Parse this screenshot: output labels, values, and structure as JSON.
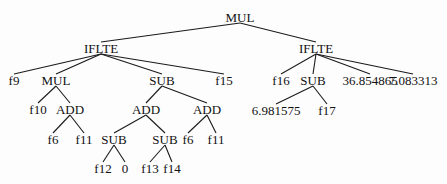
{
  "diagram": {
    "type": "expression-tree",
    "nodes": [
      {
        "id": "n0",
        "label": "MUL",
        "x": 240,
        "y": 17
      },
      {
        "id": "n1",
        "label": "IFLTE",
        "x": 101,
        "y": 48
      },
      {
        "id": "n2",
        "label": "IFLTE",
        "x": 316,
        "y": 48
      },
      {
        "id": "n3",
        "label": "f9",
        "x": 14,
        "y": 80
      },
      {
        "id": "n4",
        "label": "MUL",
        "x": 56,
        "y": 80
      },
      {
        "id": "n5",
        "label": "SUB",
        "x": 162,
        "y": 80
      },
      {
        "id": "n6",
        "label": "f15",
        "x": 224,
        "y": 80
      },
      {
        "id": "n7",
        "label": "f16",
        "x": 281,
        "y": 80
      },
      {
        "id": "n8",
        "label": "SUB",
        "x": 313,
        "y": 80
      },
      {
        "id": "n9",
        "label": "36.854865",
        "x": 370,
        "y": 80
      },
      {
        "id": "n10",
        "label": "7.083313",
        "x": 413,
        "y": 80
      },
      {
        "id": "n11",
        "label": "f10",
        "x": 38,
        "y": 109
      },
      {
        "id": "n12",
        "label": "ADD",
        "x": 70,
        "y": 109
      },
      {
        "id": "n13",
        "label": "ADD",
        "x": 146,
        "y": 109
      },
      {
        "id": "n14",
        "label": "ADD",
        "x": 207,
        "y": 109
      },
      {
        "id": "n15",
        "label": "6.981575",
        "x": 276,
        "y": 110
      },
      {
        "id": "n16",
        "label": "f17",
        "x": 327,
        "y": 110
      },
      {
        "id": "n17",
        "label": "f6",
        "x": 53,
        "y": 139
      },
      {
        "id": "n18",
        "label": "f11",
        "x": 84,
        "y": 139
      },
      {
        "id": "n19",
        "label": "SUB",
        "x": 114,
        "y": 139
      },
      {
        "id": "n20",
        "label": "SUB",
        "x": 165,
        "y": 139
      },
      {
        "id": "n21",
        "label": "f6",
        "x": 188,
        "y": 139
      },
      {
        "id": "n22",
        "label": "f11",
        "x": 216,
        "y": 139
      },
      {
        "id": "n23",
        "label": "f12",
        "x": 103,
        "y": 168
      },
      {
        "id": "n24",
        "label": "0",
        "x": 125,
        "y": 168
      },
      {
        "id": "n25",
        "label": "f13",
        "x": 150,
        "y": 168
      },
      {
        "id": "n26",
        "label": "f14",
        "x": 172,
        "y": 168
      }
    ],
    "edges": [
      [
        "n0",
        "n1"
      ],
      [
        "n0",
        "n2"
      ],
      [
        "n1",
        "n3"
      ],
      [
        "n1",
        "n4"
      ],
      [
        "n1",
        "n5"
      ],
      [
        "n1",
        "n6"
      ],
      [
        "n2",
        "n7"
      ],
      [
        "n2",
        "n8"
      ],
      [
        "n2",
        "n9"
      ],
      [
        "n2",
        "n10"
      ],
      [
        "n4",
        "n11"
      ],
      [
        "n4",
        "n12"
      ],
      [
        "n5",
        "n13"
      ],
      [
        "n5",
        "n14"
      ],
      [
        "n8",
        "n15"
      ],
      [
        "n8",
        "n16"
      ],
      [
        "n12",
        "n17"
      ],
      [
        "n12",
        "n18"
      ],
      [
        "n13",
        "n19"
      ],
      [
        "n13",
        "n20"
      ],
      [
        "n14",
        "n21"
      ],
      [
        "n14",
        "n22"
      ],
      [
        "n19",
        "n23"
      ],
      [
        "n19",
        "n24"
      ],
      [
        "n20",
        "n25"
      ],
      [
        "n20",
        "n26"
      ]
    ]
  }
}
